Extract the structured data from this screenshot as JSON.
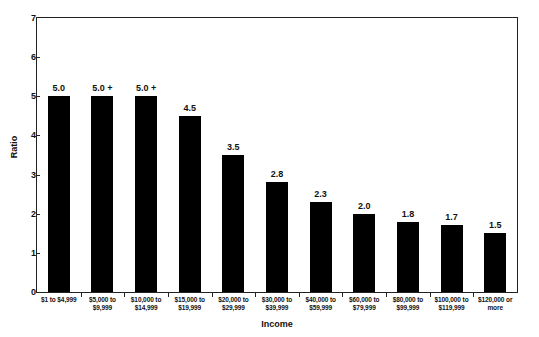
{
  "chart_data": {
    "type": "bar",
    "title": "to Current Income, 2001",
    "xlabel": "Income",
    "ylabel": "Ratio",
    "ylim": [
      0,
      7
    ],
    "ytick_values": [
      0,
      1,
      2,
      3,
      4,
      5,
      6,
      7
    ],
    "ytick_labels": [
      "0",
      "1",
      "2",
      "3",
      "4",
      "5",
      "6",
      "7"
    ],
    "grid": false,
    "legend": "none",
    "bar_color": "#000000",
    "categories": [
      "$1 to $4,999",
      "$5,000 to $9,999",
      "$10,000 to $14,999",
      "$15,000 to $19,999",
      "$20,000 to $29,999",
      "$30,000 to $39,999",
      "$40,000 to $59,999",
      "$60,000 to $79,999",
      "$80,000 to $99,999",
      "$100,000 to $119,999",
      "$120,000 or more"
    ],
    "category_lines": [
      [
        "$1 to $4,999",
        ""
      ],
      [
        "$5,000 to",
        "$9,999"
      ],
      [
        "$10,000 to",
        "$14,999"
      ],
      [
        "$15,000 to",
        "$19,999"
      ],
      [
        "$20,000 to",
        "$29,999"
      ],
      [
        "$30,000 to",
        "$39,999"
      ],
      [
        "$40,000 to",
        "$59,999"
      ],
      [
        "$60,000 to",
        "$79,999"
      ],
      [
        "$80,000 to",
        "$99,999"
      ],
      [
        "$100,000 to",
        "$119,999"
      ],
      [
        "$120,000 or",
        "more"
      ]
    ],
    "values": [
      5.0,
      5.0,
      5.0,
      4.5,
      3.5,
      2.8,
      2.3,
      2.0,
      1.8,
      1.7,
      1.5
    ],
    "value_labels": [
      "5.0",
      "5.0 +",
      "5.0 +",
      "4.5",
      "3.5",
      "2.8",
      "2.3",
      "2.0",
      "1.8",
      "1.7",
      "1.5"
    ]
  }
}
